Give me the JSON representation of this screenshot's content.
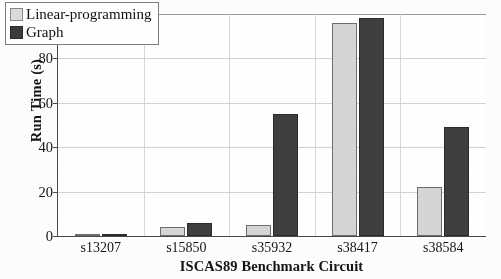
{
  "chart_data": {
    "type": "bar",
    "title": "",
    "xlabel": "ISCAS89 Benchmark Circuit",
    "ylabel": "Run Time (s)",
    "categories": [
      "s13207",
      "s15850",
      "s35932",
      "s38417",
      "s38584"
    ],
    "series": [
      {
        "name": "Linear-programming",
        "color": "#d6d6d6",
        "values": [
          1,
          4,
          5,
          96,
          22
        ]
      },
      {
        "name": "Graph",
        "color": "#3f3f3f",
        "values": [
          0.5,
          6,
          55,
          98,
          49
        ]
      }
    ],
    "ylim": [
      0,
      100
    ],
    "yticks": [
      0,
      20,
      40,
      60,
      80,
      100
    ],
    "ytick_labels": [
      "0",
      "20",
      "40",
      "60",
      "80",
      "100"
    ],
    "grid": true,
    "legend_position": "top-left"
  },
  "legend": {
    "items": [
      {
        "label": "Linear-programming",
        "swatch": "light-gray-swatch"
      },
      {
        "label": "Graph",
        "swatch": "dark-gray-swatch"
      }
    ]
  },
  "axes": {
    "y_title": "Run Time (s)",
    "x_title": "ISCAS89 Benchmark Circuit"
  }
}
